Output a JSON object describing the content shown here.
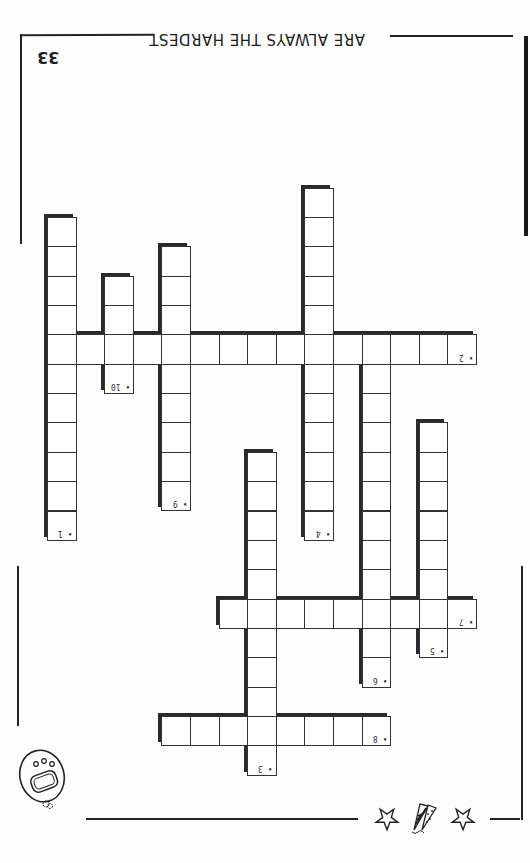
{
  "page": {
    "header": "ARE ALWAYS THE HARDEST",
    "page_number": "33",
    "orientation": "rotated-180"
  },
  "grid": {
    "origin_x": 47,
    "origin_y": 217,
    "cell_w": 28.6,
    "cell_h": 29.35
  },
  "words": [
    {
      "number": "1",
      "direction": "down",
      "col": 0,
      "row": 0,
      "length": 11
    },
    {
      "number": "2",
      "direction": "across",
      "col": 0,
      "row": 4,
      "length": 15
    },
    {
      "number": "3",
      "direction": "down",
      "col": 7,
      "row": 8,
      "length": 11
    },
    {
      "number": "4",
      "direction": "down",
      "col": 9,
      "row": -1,
      "length": 12
    },
    {
      "number": "5",
      "direction": "down",
      "col": 13,
      "row": 7,
      "length": 8
    },
    {
      "number": "6",
      "direction": "down",
      "col": 11,
      "row": 4,
      "length": 12
    },
    {
      "number": "7",
      "direction": "across",
      "col": 6,
      "row": 13,
      "length": 9
    },
    {
      "number": "8",
      "direction": "across",
      "col": 4,
      "row": 17,
      "length": 8
    },
    {
      "number": "9",
      "direction": "down",
      "col": 4,
      "row": 1,
      "length": 9
    },
    {
      "number": "10",
      "direction": "down",
      "col": 2,
      "row": 2,
      "length": 4
    }
  ],
  "decorations": {
    "balloon_icon": "balloon",
    "star_icons": [
      "star",
      "star"
    ],
    "party_horn_icon": "party-horns"
  },
  "colors": {
    "ink": "#222222",
    "paper": "#fdfdfd"
  }
}
